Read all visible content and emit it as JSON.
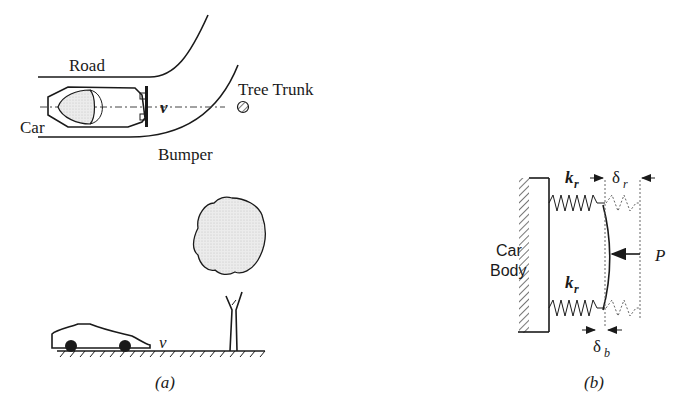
{
  "figure": {
    "panel_a": {
      "caption": "(a)",
      "top_view": {
        "labels": {
          "road": "Road",
          "car": "Car",
          "velocity": "v",
          "tree_trunk": "Tree Trunk",
          "bumper": "Bumper"
        }
      },
      "side_view": {
        "labels": {
          "velocity": "v"
        }
      }
    },
    "panel_b": {
      "caption": "(b)",
      "labels": {
        "car_body_line1": "Car",
        "car_body_line2": "Body",
        "spring_top": "k",
        "spring_top_sub": "r",
        "spring_bottom": "k",
        "spring_bottom_sub": "r",
        "delta_r": "δ",
        "delta_r_sub": "r",
        "delta_b": "δ",
        "delta_b_sub": "b",
        "force": "P"
      }
    },
    "colors": {
      "ink": "#1a1a1a",
      "fill_gray": "#e6e6e6",
      "background": "#ffffff"
    }
  }
}
